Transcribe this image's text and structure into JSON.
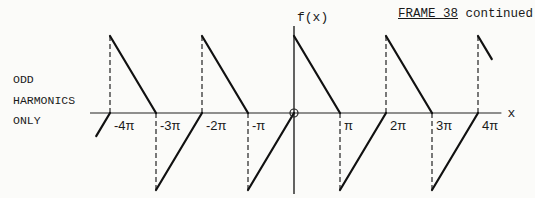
{
  "header": {
    "frame": "FRAME 38",
    "suffix": " continued"
  },
  "note": {
    "lines": [
      "ODD",
      "HARMONICS",
      "ONLY"
    ]
  },
  "chart_data": {
    "type": "line",
    "title": "",
    "xlabel": "x",
    "ylabel": "f(x)",
    "x_ticks": [
      "-4π",
      "-3π",
      "-2π",
      "-π",
      "π",
      "2π",
      "3π",
      "4π"
    ],
    "x_tick_values_pi": [
      -4,
      -3,
      -2,
      -1,
      1,
      2,
      3,
      4
    ],
    "xlim_pi": [
      -4.4,
      4.4
    ],
    "ylim": [
      -1,
      1
    ],
    "segments_pi": [
      {
        "x": [
          -4.3,
          -4
        ],
        "y": [
          -0.3,
          0
        ]
      },
      {
        "x": [
          -4,
          -3
        ],
        "y": [
          1,
          0
        ]
      },
      {
        "x": [
          -3,
          -2
        ],
        "y": [
          -1,
          0
        ]
      },
      {
        "x": [
          -2,
          -1
        ],
        "y": [
          1,
          0
        ]
      },
      {
        "x": [
          -1,
          0
        ],
        "y": [
          -1,
          0
        ]
      },
      {
        "x": [
          0,
          1
        ],
        "y": [
          1,
          0
        ]
      },
      {
        "x": [
          1,
          2
        ],
        "y": [
          -1,
          0
        ]
      },
      {
        "x": [
          2,
          3
        ],
        "y": [
          1,
          0
        ]
      },
      {
        "x": [
          3,
          4
        ],
        "y": [
          -1,
          0
        ]
      },
      {
        "x": [
          4,
          4.3
        ],
        "y": [
          1,
          0.7
        ]
      }
    ],
    "dashed_verticals_pi": [
      {
        "x": -4,
        "y": [
          0,
          1
        ]
      },
      {
        "x": -3,
        "y": [
          0,
          -1
        ]
      },
      {
        "x": -2,
        "y": [
          0,
          1
        ]
      },
      {
        "x": -1,
        "y": [
          0,
          -1
        ]
      },
      {
        "x": 1,
        "y": [
          0,
          -1
        ]
      },
      {
        "x": 2,
        "y": [
          0,
          1
        ]
      },
      {
        "x": 3,
        "y": [
          0,
          -1
        ]
      },
      {
        "x": 4,
        "y": [
          0,
          1
        ]
      }
    ],
    "origin_marker": "circle",
    "grid": false,
    "legend": null
  }
}
